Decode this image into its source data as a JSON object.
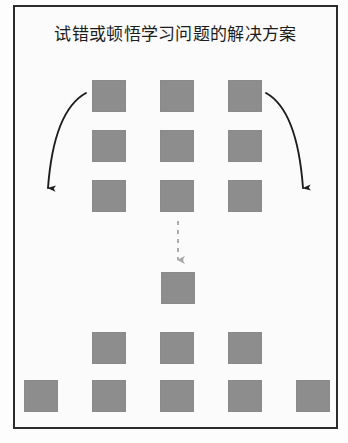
{
  "figure": {
    "title": "试错或顿悟学习问题的解决方案",
    "frame": {
      "x": 13,
      "y": 5,
      "width": 325,
      "height": 424,
      "border_color": "#2b2b2b",
      "background": "#fbfbfb"
    },
    "square": {
      "fill_color": "#8d8d8d",
      "width": 34,
      "height": 32
    },
    "columns_x": [
      24,
      92,
      160,
      228,
      296
    ],
    "rows": [
      {
        "name": "top-grid-row-1",
        "y": 80,
        "squares_x": [
          92,
          160,
          228
        ]
      },
      {
        "name": "top-grid-row-2",
        "y": 130,
        "squares_x": [
          92,
          160,
          228
        ]
      },
      {
        "name": "top-grid-row-3",
        "y": 180,
        "squares_x": [
          92,
          160,
          228
        ]
      },
      {
        "name": "center-solution-row",
        "y": 272,
        "squares_x": [
          161
        ]
      },
      {
        "name": "lower-row-of-three",
        "y": 332,
        "squares_x": [
          92,
          160,
          228
        ]
      },
      {
        "name": "bottom-row-of-five",
        "y": 380,
        "squares_x": [
          24,
          92,
          160,
          228,
          296
        ]
      }
    ],
    "arrows": [
      {
        "name": "left-curved-arrow",
        "style": "solid",
        "color": "#1d1d1d",
        "start": [
          86,
          93
        ],
        "end": [
          48,
          198
        ],
        "direction": "down-left"
      },
      {
        "name": "right-curved-arrow",
        "style": "solid",
        "color": "#1d1d1d",
        "start": [
          266,
          93
        ],
        "end": [
          303,
          198
        ],
        "direction": "down-right"
      },
      {
        "name": "center-dashed-arrow",
        "style": "dashed",
        "color": "#a9a9a9",
        "start": [
          178,
          221
        ],
        "end": [
          178,
          268
        ],
        "direction": "down"
      }
    ]
  }
}
